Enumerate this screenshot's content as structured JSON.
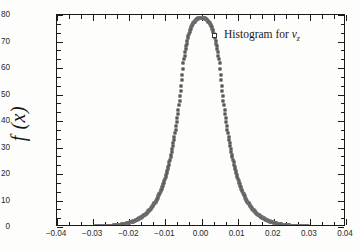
{
  "chart_data": {
    "type": "line",
    "title": "",
    "xlabel": "",
    "ylabel": "f (x)",
    "xlim": [
      -0.04,
      0.04
    ],
    "ylim": [
      0,
      80
    ],
    "grid": false,
    "legend_position": "top-right",
    "x_ticks": [
      "-0.04",
      "-0.03",
      "-0.02",
      "-0.01",
      "0.00",
      "0.01",
      "0.02",
      "0.03",
      "0.04"
    ],
    "x_tick_values": [
      -0.04,
      -0.03,
      -0.02,
      -0.01,
      0.0,
      0.01,
      0.02,
      0.03,
      0.04
    ],
    "y_ticks": [
      "0",
      "10",
      "20",
      "30",
      "40",
      "50",
      "60",
      "70",
      "80"
    ],
    "y_tick_values": [
      0,
      10,
      20,
      30,
      40,
      50,
      60,
      70,
      80
    ],
    "x_minor_per_major": 2,
    "y_minor_per_major": 2,
    "series": [
      {
        "name": "Histogram for v_z",
        "legend_label_plain": "Histogram for",
        "legend_symbol": "v",
        "legend_subscript": "z",
        "marker": "open-square",
        "marker_color": "#262626",
        "x": [
          -0.04,
          -0.039,
          -0.038,
          -0.037,
          -0.036,
          -0.035,
          -0.034,
          -0.033,
          -0.032,
          -0.031,
          -0.03,
          -0.029,
          -0.028,
          -0.027,
          -0.026,
          -0.025,
          -0.024,
          -0.0235,
          -0.023,
          -0.0225,
          -0.022,
          -0.0215,
          -0.021,
          -0.0205,
          -0.02,
          -0.0195,
          -0.019,
          -0.0185,
          -0.018,
          -0.0175,
          -0.017,
          -0.0165,
          -0.016,
          -0.0155,
          -0.015,
          -0.0145,
          -0.014,
          -0.0135,
          -0.013,
          -0.0125,
          -0.012,
          -0.0115,
          -0.011,
          -0.0105,
          -0.01,
          -0.0095,
          -0.009,
          -0.0085,
          -0.008,
          -0.0075,
          -0.007,
          -0.0065,
          -0.006,
          -0.0055,
          -0.005,
          -0.0045,
          -0.004,
          -0.0036,
          -0.0032,
          -0.0028,
          -0.0024,
          -0.002,
          -0.0017,
          -0.0014,
          -0.0011,
          -0.0009,
          -0.0007,
          -0.0005,
          -0.0003,
          -0.0001,
          0.0,
          0.0001,
          0.0003,
          0.0005,
          0.0007,
          0.0009,
          0.0011,
          0.0014,
          0.0017,
          0.002,
          0.0024,
          0.0028,
          0.0032,
          0.0036,
          0.004,
          0.0045,
          0.005,
          0.0055,
          0.006,
          0.0065,
          0.007,
          0.0075,
          0.008,
          0.0085,
          0.009,
          0.0095,
          0.01,
          0.0105,
          0.011,
          0.0115,
          0.012,
          0.0125,
          0.013,
          0.0135,
          0.014,
          0.0145,
          0.015,
          0.0155,
          0.016,
          0.0165,
          0.017,
          0.0175,
          0.018,
          0.0185,
          0.019,
          0.0195,
          0.02,
          0.0205,
          0.021,
          0.0215,
          0.022,
          0.0225,
          0.023,
          0.0235,
          0.024,
          0.025,
          0.026,
          0.027,
          0.028,
          0.029,
          0.03,
          0.031,
          0.032,
          0.033,
          0.034,
          0.035,
          0.036,
          0.037,
          0.038,
          0.039,
          0.04
        ],
        "y": [
          0.05,
          0.05,
          0.06,
          0.06,
          0.07,
          0.08,
          0.09,
          0.1,
          0.12,
          0.14,
          0.17,
          0.2,
          0.25,
          0.31,
          0.39,
          0.49,
          0.62,
          0.7,
          0.79,
          0.89,
          1.0,
          1.13,
          1.28,
          1.44,
          1.63,
          1.84,
          2.08,
          2.35,
          2.65,
          2.99,
          3.38,
          3.82,
          4.31,
          4.87,
          5.5,
          6.21,
          7.01,
          7.91,
          8.93,
          10.08,
          11.38,
          12.84,
          14.5,
          16.36,
          18.47,
          20.84,
          23.53,
          26.56,
          29.98,
          33.84,
          38.2,
          43.12,
          48.68,
          54.95,
          62.03,
          66.5,
          69.8,
          72.2,
          74.1,
          75.5,
          76.6,
          77.4,
          77.9,
          78.3,
          78.6,
          78.75,
          78.85,
          78.92,
          78.97,
          78.99,
          79.0,
          78.99,
          78.97,
          78.92,
          78.85,
          78.75,
          78.6,
          78.3,
          77.9,
          77.4,
          76.6,
          75.5,
          74.1,
          72.2,
          69.8,
          66.5,
          62.03,
          54.95,
          48.68,
          43.12,
          38.2,
          33.84,
          29.98,
          26.56,
          23.53,
          20.84,
          18.47,
          16.36,
          14.5,
          12.84,
          11.38,
          10.08,
          8.93,
          7.91,
          7.01,
          6.21,
          5.5,
          4.87,
          4.31,
          3.82,
          3.38,
          2.99,
          2.65,
          2.35,
          2.08,
          1.84,
          1.63,
          1.44,
          1.28,
          1.13,
          1.0,
          0.89,
          0.79,
          0.7,
          0.62,
          0.49,
          0.39,
          0.31,
          0.25,
          0.2,
          0.17,
          0.14,
          0.12,
          0.1,
          0.09,
          0.08,
          0.07,
          0.06,
          0.06,
          0.05,
          0.05
        ]
      }
    ],
    "peak_value": 79,
    "peak_x": 0.0
  }
}
